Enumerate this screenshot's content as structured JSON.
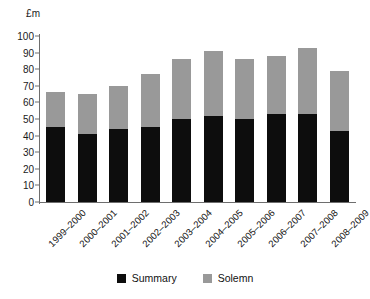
{
  "chart_data": {
    "type": "bar",
    "stacked": true,
    "title": "",
    "xlabel": "",
    "ylabel": "£m",
    "ylim": [
      0,
      100
    ],
    "yticks": [
      0,
      10,
      20,
      30,
      40,
      50,
      60,
      70,
      80,
      90,
      100
    ],
    "grid": false,
    "legend_position": "bottom-center",
    "categories": [
      "1999–2000",
      "2000–2001",
      "2001–2002",
      "2002–2003",
      "2003–2004",
      "2004–2005",
      "2005–2006",
      "2006–2007",
      "2007–2008",
      "2008–2009"
    ],
    "series": [
      {
        "name": "Summary",
        "color": "#0d0d0d",
        "values": [
          45,
          41,
          44,
          45,
          50,
          52,
          50,
          53,
          53,
          43
        ]
      },
      {
        "name": "Solemn",
        "color": "#999999",
        "values": [
          21,
          24,
          26,
          32,
          36,
          39,
          36,
          35,
          40,
          36
        ]
      }
    ],
    "totals": [
      66,
      65,
      70,
      77,
      86,
      91,
      86,
      88,
      93,
      79
    ]
  },
  "axis": {
    "unit_label": "£m",
    "tick_labels": [
      "100",
      "90",
      "80",
      "70",
      "60",
      "50",
      "40",
      "30",
      "20",
      "10",
      "0"
    ]
  },
  "legend": {
    "items": [
      {
        "label": "Summary",
        "color": "#0d0d0d",
        "swatch": "summary-swatch"
      },
      {
        "label": "Solemn",
        "color": "#999999",
        "swatch": "solemn-swatch"
      }
    ]
  }
}
